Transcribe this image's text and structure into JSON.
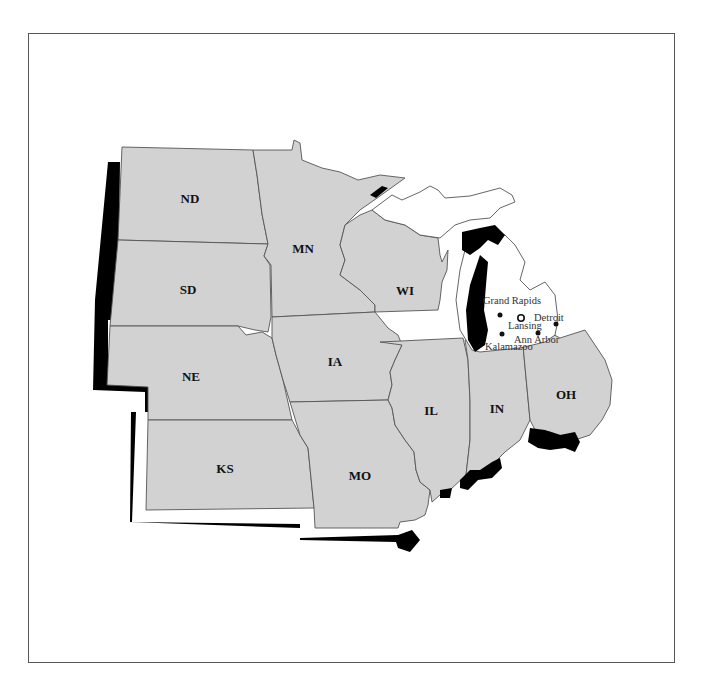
{
  "map": {
    "type": "regional state map - Midwest",
    "colors": {
      "states": "#d2d2d2",
      "highlight": "#ffffff",
      "shadow": "#000000",
      "border": "#555555"
    },
    "states": [
      {
        "abbr": "ND"
      },
      {
        "abbr": "MN"
      },
      {
        "abbr": "SD"
      },
      {
        "abbr": "WI"
      },
      {
        "abbr": "NE"
      },
      {
        "abbr": "IA"
      },
      {
        "abbr": "IL"
      },
      {
        "abbr": "IN"
      },
      {
        "abbr": "OH"
      },
      {
        "abbr": "KS"
      },
      {
        "abbr": "MO"
      }
    ],
    "highlighted_state": "Michigan (unlabeled, white)",
    "cities": [
      {
        "name": "Grand Rapids",
        "marker": "dot"
      },
      {
        "name": "Lansing",
        "marker": "star-circle"
      },
      {
        "name": "Detroit",
        "marker": "dot"
      },
      {
        "name": "Ann Arbor",
        "marker": "dot"
      },
      {
        "name": "Kalamazoo",
        "marker": "dot"
      }
    ]
  }
}
